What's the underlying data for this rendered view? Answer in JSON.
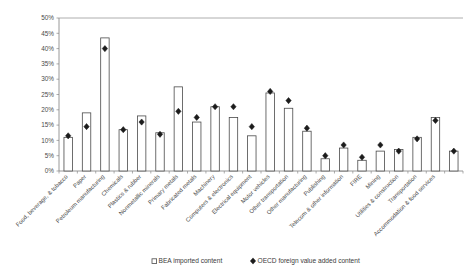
{
  "chart_data": {
    "type": "bar",
    "title": "",
    "subtitle": "",
    "xlabel": "",
    "ylabel": "",
    "ylim": [
      0,
      50
    ],
    "ytick_labels": [
      "0%",
      "5%",
      "10%",
      "15%",
      "20%",
      "25%",
      "30%",
      "35%",
      "40%",
      "45%",
      "50%"
    ],
    "ytick_values": [
      0,
      5,
      10,
      15,
      20,
      25,
      30,
      35,
      40,
      45,
      50
    ],
    "grid": false,
    "legend_position": "bottom",
    "categories": [
      "Food, beverage, & tobacco",
      "Paper",
      "Petroleum manufacturing",
      "Chemicals",
      "Plastics & rubber",
      "Nonmetallic minerals",
      "Primary metals",
      "Fabricated metals",
      "Machinery",
      "Computers & electronics",
      "Electrical equipment",
      "Motor vehicles",
      "Other transportation",
      "Other manufacturing",
      "Publishing",
      "Telecom & other information",
      "FIRE",
      "Mining",
      "Utilities & construction",
      "Transportation",
      "Accommodation & food services"
    ],
    "series": [
      {
        "name": "BEA imported content",
        "type": "bar",
        "values": [
          11.0,
          19.0,
          43.5,
          13.5,
          18.0,
          12.5,
          27.5,
          16.0,
          21.0,
          17.5,
          11.5,
          25.5,
          20.5,
          13.0,
          4.0,
          7.5,
          3.5,
          6.5,
          7.0,
          11.0,
          17.5
        ]
      },
      {
        "name": "OECD foreign value added content",
        "type": "scatter",
        "values": [
          11.5,
          14.5,
          40.0,
          13.5,
          16.0,
          12.0,
          19.5,
          17.5,
          21.0,
          21.0,
          14.5,
          26.0,
          23.0,
          14.0,
          5.0,
          8.5,
          4.5,
          8.5,
          6.5,
          10.5,
          16.5
        ]
      }
    ],
    "final_bar": {
      "value": 6.5,
      "marker": 6.5
    }
  },
  "legend": {
    "items": [
      {
        "label": "BEA imported content",
        "marker": "square-outline-icon"
      },
      {
        "label": "OECD foreign value added content",
        "marker": "diamond-icon"
      }
    ]
  }
}
